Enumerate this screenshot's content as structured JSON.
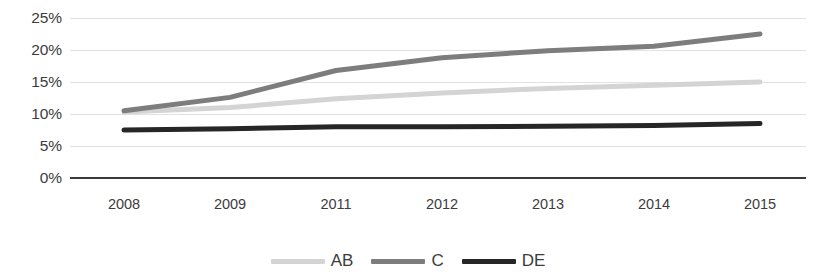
{
  "chart_data": {
    "type": "line",
    "title": "",
    "subtitle": "",
    "xlabel": "",
    "ylabel": "",
    "grid": true,
    "legend_position": "bottom-center",
    "categories": [
      "2008",
      "2009",
      "2011",
      "2012",
      "2013",
      "2014",
      "2015"
    ],
    "ylim": [
      0,
      25
    ],
    "yticks": [
      0,
      5,
      10,
      15,
      20,
      25
    ],
    "ytick_labels": [
      "0%",
      "5%",
      "10%",
      "15%",
      "20%",
      "25%"
    ],
    "series": [
      {
        "name": "AB",
        "color": "#d4d4d4",
        "values": [
          10.3,
          11.0,
          12.4,
          13.3,
          14.0,
          14.5,
          15.0
        ]
      },
      {
        "name": "C",
        "color": "#7d7d7d",
        "values": [
          10.5,
          12.6,
          16.8,
          18.8,
          19.9,
          20.6,
          22.5
        ]
      },
      {
        "name": "DE",
        "color": "#262626",
        "values": [
          7.5,
          7.7,
          8.0,
          8.0,
          8.1,
          8.2,
          8.5
        ]
      }
    ]
  },
  "axis": {
    "baseline_color": "#3a3a3a",
    "gridline_color": "#e2e2e2"
  },
  "legend": {
    "entries": [
      {
        "label": "AB",
        "color": "#d4d4d4"
      },
      {
        "label": "C",
        "color": "#7d7d7d"
      },
      {
        "label": "DE",
        "color": "#262626"
      }
    ]
  }
}
